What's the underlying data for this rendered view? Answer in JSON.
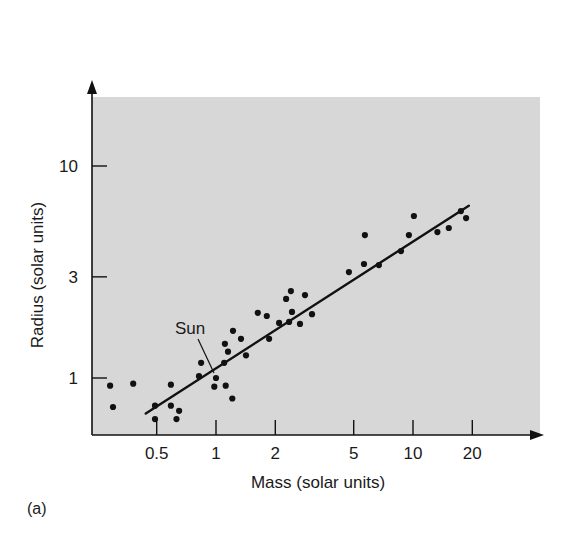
{
  "chart_data": {
    "type": "scatter",
    "title": "",
    "panel_label": "(a)",
    "xlabel": "Mass (solar units)",
    "ylabel": "Radius (solar units)",
    "xscale": "log",
    "yscale": "log",
    "xlim": [
      0.27,
      28
    ],
    "ylim": [
      0.6,
      20
    ],
    "xticks": [
      0.5,
      1,
      2,
      5,
      10,
      20
    ],
    "xtick_labels": [
      "0.5",
      "1",
      "2",
      "5",
      "10",
      "20"
    ],
    "yticks": [
      1,
      3,
      10
    ],
    "ytick_labels": [
      "1",
      "3",
      "10"
    ],
    "grid": false,
    "legend": null,
    "background": "#d7d7d7",
    "series": [
      {
        "name": "Main-sequence stars",
        "kind": "scatter",
        "color": "#111111",
        "points": [
          [
            0.29,
            0.92
          ],
          [
            0.3,
            0.73
          ],
          [
            0.38,
            0.94
          ],
          [
            0.49,
            0.74
          ],
          [
            0.49,
            0.64
          ],
          [
            0.59,
            0.93
          ],
          [
            0.59,
            0.74
          ],
          [
            0.65,
            0.7
          ],
          [
            0.63,
            0.64
          ],
          [
            0.84,
            1.18
          ],
          [
            0.82,
            1.02
          ],
          [
            1.0,
            1.0
          ],
          [
            0.98,
            0.91
          ],
          [
            1.12,
            0.92
          ],
          [
            1.21,
            0.8
          ],
          [
            1.1,
            1.18
          ],
          [
            1.11,
            1.45
          ],
          [
            1.15,
            1.33
          ],
          [
            1.22,
            1.67
          ],
          [
            1.34,
            1.53
          ],
          [
            1.42,
            1.28
          ],
          [
            1.63,
            2.03
          ],
          [
            1.81,
            1.96
          ],
          [
            1.86,
            1.53
          ],
          [
            2.09,
            1.82
          ],
          [
            2.35,
            1.84
          ],
          [
            2.27,
            2.36
          ],
          [
            2.4,
            2.57
          ],
          [
            2.43,
            2.05
          ],
          [
            2.67,
            1.8
          ],
          [
            2.83,
            2.46
          ],
          [
            3.07,
            2.0
          ],
          [
            4.73,
            3.16
          ],
          [
            5.64,
            3.45
          ],
          [
            5.7,
            4.72
          ],
          [
            6.71,
            3.41
          ],
          [
            8.69,
            3.97
          ],
          [
            9.53,
            4.72
          ],
          [
            10.1,
            5.81
          ],
          [
            13.3,
            4.88
          ],
          [
            15.2,
            5.1
          ],
          [
            17.5,
            6.13
          ],
          [
            18.6,
            5.68
          ]
        ]
      },
      {
        "name": "Best-fit line",
        "kind": "line",
        "color": "#111111",
        "points": [
          [
            0.44,
            0.68
          ],
          [
            19.2,
            6.5
          ]
        ]
      }
    ],
    "annotations": [
      {
        "text": "Sun",
        "target": [
          1.0,
          1.0
        ],
        "text_pos_px": [
          175,
          334
        ],
        "leader_from_px": [
          198,
          339
        ]
      }
    ]
  },
  "layout": {
    "plot_left": 92,
    "plot_top": 97,
    "plot_right": 540,
    "plot_bottom": 435,
    "x_origin_px": 216,
    "x_px_per_decade": 197,
    "y_origin_px": 378,
    "y_px_per_decade": 212
  }
}
